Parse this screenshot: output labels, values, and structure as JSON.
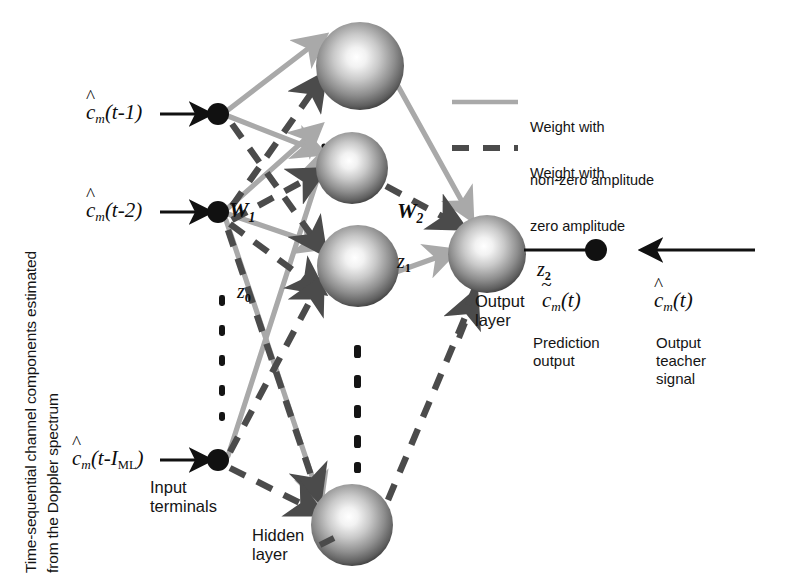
{
  "figure": {
    "width": 785,
    "height": 588,
    "background": "#ffffff"
  },
  "colors": {
    "solid_weight": "#a9a9a9",
    "dashed_weight": "#4b4b4b",
    "node_dark": "#111111",
    "sphere_highlight": "#ffffff",
    "sphere_edge": "#3a3a3a",
    "text": "#141414"
  },
  "side_label": {
    "line1": "Time-sequential channel components estimated",
    "line2": "from the Doppler spectrum"
  },
  "inputs": [
    {
      "id": "input-1",
      "label_c": "c",
      "label_sub": "m",
      "label_arg": "(t-1)",
      "accent": "hat"
    },
    {
      "id": "input-2",
      "label_c": "c",
      "label_sub": "m",
      "label_arg": "(t-2)",
      "accent": "hat"
    },
    {
      "id": "input-3",
      "label_c": "c",
      "label_sub": "m",
      "label_arg": "(t-I",
      "label_arg2": "ML",
      "label_arg3": ")",
      "accent": "hat"
    }
  ],
  "labels": {
    "input_terminals": "Input\nterminals",
    "hidden_layer": "Hidden\nlayer",
    "output_layer": "Output\nlayer",
    "prediction_output": "Prediction\noutput",
    "output_teacher_signal": "Output\nteacher\nsignal",
    "w1": "W",
    "w1_sub": "1",
    "w2": "W",
    "w2_sub": "2",
    "z0": "z",
    "z0_sub": "0",
    "z1": "z",
    "z1_sub": "1",
    "z2": "z",
    "z2_sub": "2"
  },
  "output_labels": {
    "prediction_symbol_c": "c",
    "prediction_symbol_sub": "m",
    "prediction_symbol_arg": "(t)",
    "prediction_accent": "tilde",
    "teacher_symbol_c": "c",
    "teacher_symbol_sub": "m",
    "teacher_symbol_arg": "(t)",
    "teacher_accent": "hat"
  },
  "legend": [
    {
      "id": "legend-nonzero",
      "style": "solid",
      "color": "#a9a9a9",
      "line1": "Weight with",
      "line2": "non-zero amplitude"
    },
    {
      "id": "legend-zero",
      "style": "dashed",
      "color": "#4b4b4b",
      "line1": "Weight with",
      "line2": "zero amplitude"
    }
  ],
  "nodes": {
    "input_terminals": [
      {
        "id": "in-1",
        "cx": 218,
        "cy": 114,
        "r": 11
      },
      {
        "id": "in-2",
        "cx": 218,
        "cy": 212,
        "r": 11
      },
      {
        "id": "in-3",
        "cx": 218,
        "cy": 460,
        "r": 11
      }
    ],
    "hidden_neurons": [
      {
        "id": "h-1",
        "cx": 360,
        "cy": 66,
        "r": 44
      },
      {
        "id": "h-2",
        "cx": 352,
        "cy": 168,
        "r": 36
      },
      {
        "id": "h-3",
        "cx": 358,
        "cy": 266,
        "r": 41
      },
      {
        "id": "h-4",
        "cx": 352,
        "cy": 525,
        "r": 41
      }
    ],
    "output_neuron": {
      "id": "out-1",
      "cx": 487,
      "cy": 254,
      "r": 39
    },
    "teacher_node": {
      "id": "teacher-dot",
      "cx": 596,
      "cy": 250,
      "r": 11
    }
  },
  "ellipsis": [
    {
      "id": "ellipsis-input",
      "x": 222,
      "y_start": 295,
      "y_end": 415,
      "dots": 5
    },
    {
      "id": "ellipsis-hidden",
      "x": 357,
      "y_start": 345,
      "y_end": 460,
      "dots": 5
    }
  ]
}
